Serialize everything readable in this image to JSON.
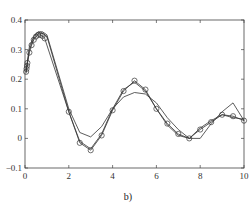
{
  "chart_data": {
    "type": "line",
    "title": "",
    "caption": "b)",
    "xlabel": "",
    "ylabel": "",
    "xlim": [
      0,
      10
    ],
    "ylim": [
      -0.1,
      0.4
    ],
    "xticks": [
      0,
      2,
      4,
      6,
      8,
      10
    ],
    "xtick_labels": [
      "0",
      "2",
      "4",
      "6",
      "8",
      "10"
    ],
    "yticks": [
      -0.1,
      0,
      0.1,
      0.2,
      0.3,
      0.4
    ],
    "ytick_labels": [
      "−0.1",
      "0",
      "0.1",
      "0.2",
      "0.3",
      "0.4"
    ],
    "grid": false,
    "legend": "none",
    "series": [
      {
        "name": "reference-markers",
        "style": "circles",
        "x": [
          0.05,
          0.07,
          0.09,
          0.11,
          0.2,
          0.3,
          0.4,
          0.5,
          0.6,
          0.7,
          0.8,
          0.9,
          2.0,
          2.5,
          3.0,
          3.5,
          4.0,
          4.5,
          5.0,
          5.5,
          6.0,
          6.5,
          7.0,
          7.5,
          8.0,
          8.5,
          9.0,
          9.5,
          10.0
        ],
        "y": [
          0.225,
          0.235,
          0.245,
          0.255,
          0.29,
          0.315,
          0.333,
          0.344,
          0.35,
          0.35,
          0.346,
          0.338,
          0.09,
          -0.015,
          -0.04,
          0.01,
          0.095,
          0.16,
          0.195,
          0.165,
          0.1,
          0.05,
          0.015,
          0.0,
          0.03,
          0.055,
          0.08,
          0.075,
          0.06
        ]
      },
      {
        "name": "model-a",
        "style": "line",
        "x": [
          0.05,
          0.2,
          0.4,
          0.6,
          0.8,
          1.0,
          2.0,
          2.5,
          3.0,
          3.5,
          4.0,
          4.5,
          5.0,
          5.5,
          6.0,
          6.5,
          7.0,
          7.5,
          8.0,
          8.5,
          9.0,
          9.5,
          10.0
        ],
        "y": [
          0.22,
          0.3,
          0.34,
          0.355,
          0.355,
          0.345,
          0.09,
          -0.01,
          -0.035,
          0.015,
          0.1,
          0.165,
          0.19,
          0.16,
          0.1,
          0.045,
          0.01,
          0.0,
          0.035,
          0.06,
          0.08,
          0.07,
          0.065
        ]
      },
      {
        "name": "model-b",
        "style": "line",
        "x": [
          0.05,
          0.2,
          0.4,
          0.6,
          0.8,
          1.0,
          2.0,
          2.5,
          3.0,
          3.5,
          4.0,
          4.5,
          5.0,
          5.5,
          6.0,
          6.5,
          7.0,
          7.5,
          8.0,
          8.5,
          9.0,
          9.5,
          10.0
        ],
        "y": [
          0.23,
          0.31,
          0.345,
          0.36,
          0.36,
          0.35,
          0.1,
          0.02,
          0.005,
          0.04,
          0.1,
          0.14,
          0.155,
          0.15,
          0.12,
          0.07,
          0.03,
          0.0,
          0.0,
          0.05,
          0.09,
          0.12,
          0.06
        ]
      }
    ]
  }
}
